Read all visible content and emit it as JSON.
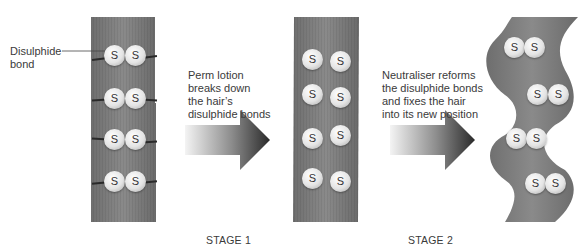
{
  "diagram": {
    "colors": {
      "hair_strand": "#7a7a7a",
      "sulphur_atom": "#e6e6e6",
      "bond_line": "#2a2a2a",
      "arrow_dark": "#2e2e2e",
      "arrow_light": "#f2f2f2",
      "text": "#3a3a3a"
    },
    "callout": {
      "label": "Disulphide\nbond",
      "label_line1": "Disulphide",
      "label_line2": "bond"
    },
    "atom_symbol": "S",
    "strands": [
      {
        "id": "before",
        "state": "straight, bonded",
        "pairs": 4,
        "bonded": true
      },
      {
        "id": "broken",
        "state": "straight, bonds broken",
        "pairs": 4,
        "bonded": false
      },
      {
        "id": "after",
        "state": "wavy, bonds reformed",
        "pairs": 4,
        "bonded": true
      }
    ],
    "steps": [
      {
        "stage": "STAGE 1",
        "caption_lines": [
          "Perm lotion",
          "breaks down",
          "the hair’s",
          "disulphide bonds"
        ]
      },
      {
        "stage": "STAGE 2",
        "caption_lines": [
          "Neutraliser reforms",
          "the disulphide bonds",
          "and fixes the hair",
          "into its new position"
        ]
      }
    ]
  }
}
